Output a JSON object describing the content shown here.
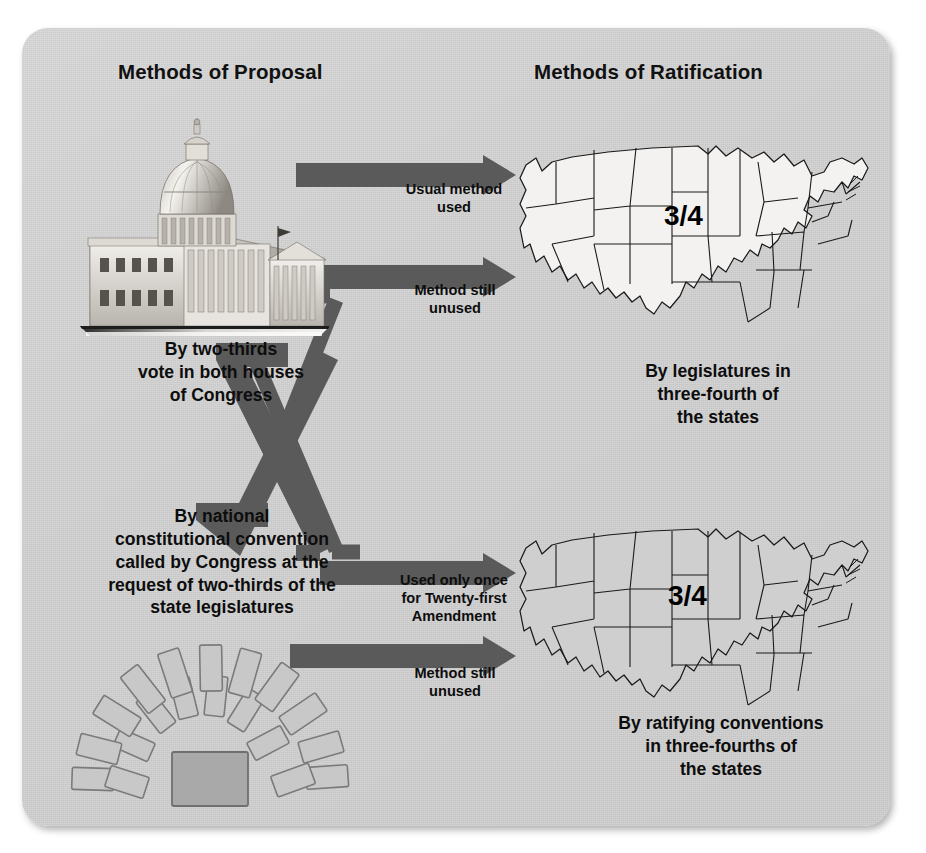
{
  "diagram": {
    "title_left": "Methods of Proposal",
    "title_right": "Methods of Ratification",
    "arrow_color": "#5a5a5a",
    "card_color": "#d4d4d4",
    "text_color": "#0d0d0d"
  },
  "proposal": {
    "congress": {
      "icon": "us-capitol-building",
      "caption": "By two-thirds\nvote in both houses\nof Congress"
    },
    "convention": {
      "icon": "convention-seating-chart",
      "caption": "By national\nconstitutional convention\ncalled by Congress at the\nrequest of two-thirds of the\nstate legislatures"
    }
  },
  "ratification": {
    "legislatures": {
      "icon": "us-map",
      "fraction": "3/4",
      "caption": "By legislatures in\nthree-fourth of\nthe states"
    },
    "conventions": {
      "icon": "us-map",
      "fraction": "3/4",
      "caption": "By ratifying conventions\nin three-fourths of\nthe states"
    }
  },
  "arrows": [
    {
      "id": "congress-to-legislatures",
      "label": "Usual method\nused",
      "from": "congress",
      "to": "legislatures"
    },
    {
      "id": "convention-to-legislatures",
      "label": "Method still\nunused",
      "from": "convention",
      "to": "legislatures"
    },
    {
      "id": "congress-to-conventions",
      "label": "Used only once\nfor Twenty-first\nAmendment",
      "from": "congress",
      "to": "conventions"
    },
    {
      "id": "convention-to-conventions",
      "label": "Method still\nunused",
      "from": "convention",
      "to": "conventions"
    }
  ]
}
